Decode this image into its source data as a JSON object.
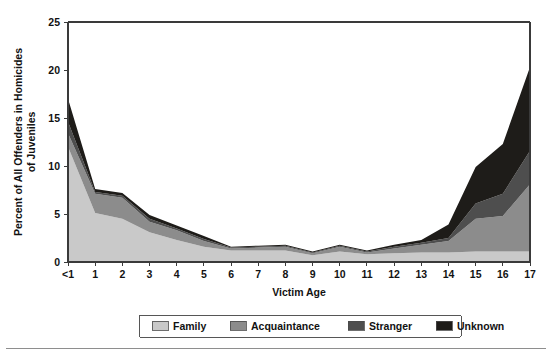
{
  "chart_data": {
    "type": "area",
    "stacked": true,
    "title": "",
    "xlabel": "Victim Age",
    "ylabel": "Percent of All Offenders in Homicides of Juveniles",
    "ylabel_lines": [
      "Percent of All Offenders in Homicides",
      "of Juveniles"
    ],
    "categories": [
      "<1",
      "1",
      "2",
      "3",
      "4",
      "5",
      "6",
      "7",
      "8",
      "9",
      "10",
      "11",
      "12",
      "13",
      "14",
      "15",
      "16",
      "17"
    ],
    "xtick_labels": [
      "<1",
      "1",
      "2",
      "3",
      "4",
      "5",
      "6",
      "7",
      "8",
      "9",
      "10",
      "11",
      "12",
      "13",
      "14",
      "15",
      "16",
      "17"
    ],
    "ytick_labels": [
      "0",
      "5",
      "10",
      "15",
      "20",
      "25"
    ],
    "yticks": [
      0,
      5,
      10,
      15,
      20,
      25
    ],
    "ylim": [
      0,
      25
    ],
    "grid": false,
    "legend_position": "bottom",
    "series": [
      {
        "name": "Family",
        "color": "#c9c9c9",
        "values": [
          12.0,
          5.1,
          4.5,
          3.1,
          2.3,
          1.6,
          1.2,
          1.2,
          1.2,
          0.7,
          1.1,
          0.8,
          0.9,
          1.0,
          1.0,
          1.1,
          1.1,
          1.1
        ]
      },
      {
        "name": "Acquaintance",
        "color": "#8c8c8c",
        "values": [
          1.4,
          2.0,
          2.2,
          1.1,
          1.0,
          0.6,
          0.2,
          0.3,
          0.4,
          0.2,
          0.5,
          0.2,
          0.5,
          0.8,
          1.2,
          3.4,
          3.7,
          7.0
        ]
      },
      {
        "name": "Stranger",
        "color": "#4e4e4e",
        "values": [
          1.2,
          0.2,
          0.2,
          0.3,
          0.2,
          0.2,
          0.1,
          0.1,
          0.1,
          0.1,
          0.1,
          0.1,
          0.2,
          0.2,
          0.3,
          1.6,
          2.3,
          3.5
        ]
      },
      {
        "name": "Unknown",
        "color": "#1e1c19",
        "values": [
          2.4,
          0.3,
          0.3,
          0.4,
          0.3,
          0.3,
          0.1,
          0.1,
          0.1,
          0.1,
          0.1,
          0.1,
          0.2,
          0.3,
          1.4,
          3.8,
          5.2,
          8.7
        ]
      }
    ],
    "totals": [
      17.0,
      7.6,
      7.2,
      4.9,
      3.8,
      2.7,
      1.6,
      1.7,
      1.8,
      1.1,
      1.8,
      1.2,
      1.8,
      2.3,
      3.9,
      9.9,
      12.3,
      20.3
    ]
  },
  "legend": {
    "items": [
      {
        "label": "Family",
        "color": "#c9c9c9"
      },
      {
        "label": "Acquaintance",
        "color": "#8c8c8c"
      },
      {
        "label": "Stranger",
        "color": "#4e4e4e"
      },
      {
        "label": "Unknown",
        "color": "#1e1c19"
      }
    ]
  },
  "colors": {
    "family": "#c9c9c9",
    "acquaintance": "#8c8c8c",
    "stranger": "#4e4e4e",
    "unknown": "#1e1c19",
    "axis": "#3a3a3a",
    "text": "#121212"
  }
}
